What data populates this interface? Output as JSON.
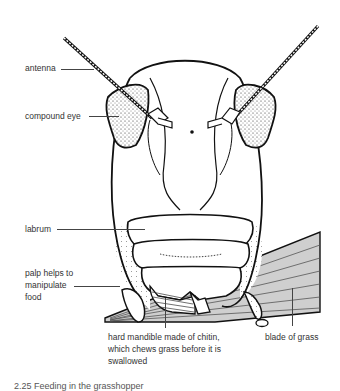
{
  "diagram": {
    "labels": {
      "antenna": "antenna",
      "compound_eye": "compound eye",
      "labrum": "labrum",
      "palp_line1": "palp helps to",
      "palp_line2": "manipulate",
      "palp_line3": "food",
      "mandible_line1": "hard mandible made of chitin,",
      "mandible_line2": "which chews grass before it is",
      "mandible_line3": "swallowed",
      "grass": "blade of grass"
    },
    "caption": "2.25   Feeding in the grasshopper",
    "colors": {
      "ink": "#111111",
      "label_text": "#333333",
      "grass_fill": "#cfcfcf",
      "background": "#ffffff"
    }
  }
}
